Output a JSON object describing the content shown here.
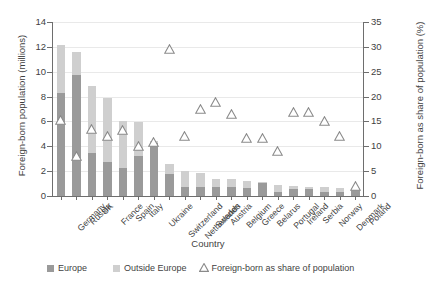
{
  "chart_data": {
    "type": "bar",
    "title": "",
    "xlabel": "Country",
    "ylabel": "Foreign-born population  (millions)",
    "y2label": "Foreign-born as share of population (%)",
    "ylim": [
      0,
      14
    ],
    "y2lim": [
      0,
      35
    ],
    "y_ticks": [
      "0",
      "2",
      "4",
      "6",
      "8",
      "10",
      "12",
      "14"
    ],
    "y2_ticks": [
      "0",
      "5",
      "10",
      "15",
      "20",
      "25",
      "30",
      "35"
    ],
    "grid": true,
    "legend_position": "bottom",
    "categories": [
      "Germany",
      "Russia",
      "UK",
      "France",
      "Spain",
      "Italy",
      "Ukraine",
      "Switzerland",
      "Netherlands",
      "Sweden",
      "Austria",
      "Belgium",
      "Greece",
      "Belarus",
      "Portugal",
      "Ireland",
      "Serbia",
      "Norway",
      "Denmark",
      "Poland"
    ],
    "series": [
      {
        "name": "Europe",
        "color": "#9a9a9a",
        "values": [
          8.3,
          9.7,
          3.45,
          2.7,
          2.25,
          3.25,
          4.3,
          1.75,
          0.7,
          0.7,
          0.75,
          0.75,
          0.65,
          1.05,
          0.35,
          0.55,
          0.6,
          0.35,
          0.35,
          0.5
        ]
      },
      {
        "name": "Outside Europe",
        "color": "#cfcfcf",
        "values": [
          3.85,
          1.9,
          5.4,
          5.2,
          3.75,
          2.7,
          0.15,
          0.8,
          1.3,
          1.15,
          0.65,
          0.6,
          0.55,
          0.05,
          0.5,
          0.25,
          0.1,
          0.35,
          0.3,
          0.1
        ]
      }
    ],
    "marker_series": {
      "name": "Foreign-born as share of population",
      "marker": "triangle-up",
      "axis": "right",
      "values": [
        15.2,
        8.1,
        13.4,
        12.1,
        13.2,
        10.1,
        10.9,
        29.6,
        12.1,
        17.4,
        19.0,
        16.5,
        11.6,
        11.7,
        9.0,
        16.9,
        16.8,
        15.1,
        12.0,
        2.0
      ]
    }
  },
  "legend": {
    "europe": "Europe",
    "outside_europe": "Outside Europe",
    "share": "Foreign-born as share of population"
  }
}
